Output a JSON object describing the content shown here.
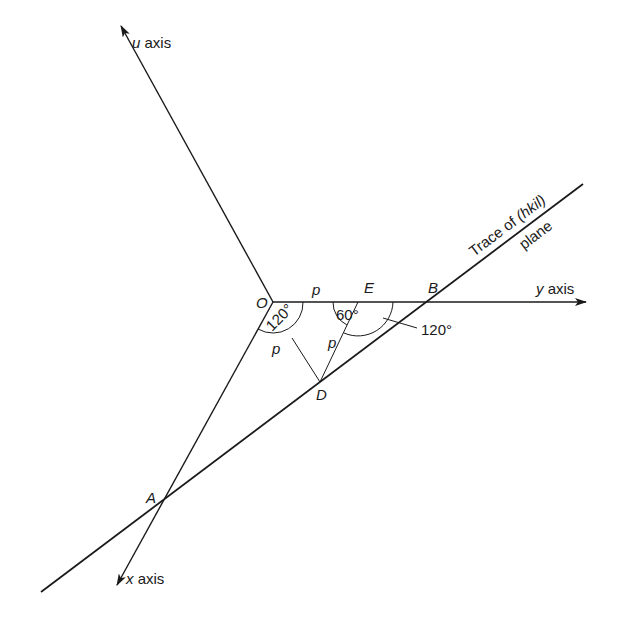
{
  "diagram": {
    "axes": {
      "u": {
        "label_var": "u",
        "label_word": "axis"
      },
      "y": {
        "label_var": "y",
        "label_word": "axis"
      },
      "x": {
        "label_var": "x",
        "label_word": "axis"
      }
    },
    "points": {
      "O": "O",
      "E": "E",
      "B": "B",
      "D": "D",
      "A": "A"
    },
    "segment_labels": {
      "OE": "p",
      "OD": "p",
      "ED": "p"
    },
    "angles": {
      "at_O": "120°",
      "at_E": "60°",
      "at_B_side": "120°"
    },
    "trace_label": {
      "line1": "Trace of (hkil)",
      "line2": "plane"
    },
    "colors": {
      "ink": "#1a1a1a",
      "background": "#ffffff"
    }
  }
}
